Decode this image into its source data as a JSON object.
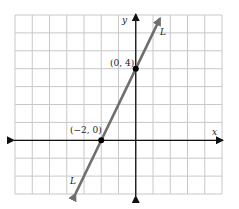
{
  "chart_data": {
    "type": "line",
    "title": "",
    "xlabel": "x",
    "ylabel": "y",
    "xlim": [
      -7,
      5
    ],
    "ylim": [
      -3,
      7
    ],
    "grid": true,
    "grid_step": 1,
    "tick_labels": false,
    "series": [
      {
        "name": "L",
        "equation": "y = 2x + 4",
        "slope": 2,
        "intercept": 4,
        "x": [
          -3.5,
          1.4
        ],
        "y": [
          -3,
          6.8
        ],
        "arrows_both_ends": true,
        "color": "#6e6e6e"
      }
    ],
    "points": [
      {
        "label": "(0, 4)",
        "x": 0,
        "y": 4
      },
      {
        "label": "(−2, 0)",
        "x": -2,
        "y": 0
      }
    ],
    "annotations": [
      {
        "text": "L",
        "near": "top end of line"
      },
      {
        "text": "L",
        "near": "bottom end of line"
      }
    ]
  },
  "labels": {
    "x_axis": "x",
    "y_axis": "y",
    "line_top": "L",
    "line_bottom": "L",
    "point_y_intercept": "(0, 4)",
    "point_x_intercept": "(−2, 0)"
  },
  "colors": {
    "grid": "#c8c8c8",
    "axis": "#111111",
    "line": "#6e6e6e",
    "point": "#000000"
  }
}
